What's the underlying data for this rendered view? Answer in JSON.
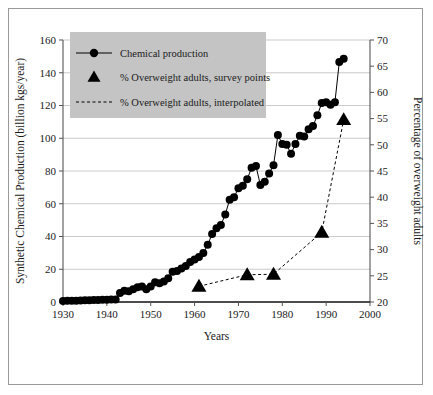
{
  "figure": {
    "background_color": "#ffffff",
    "border_color": "#9a9a9a",
    "legend_background": "#c4c4c4",
    "series_color": "#000000",
    "gridline_color": "#b5b5b5"
  },
  "chart_data": {
    "type": "line",
    "title": "",
    "xlabel": "Years",
    "ylabel": "Synthetic Chemical Production (billion kgs/year)",
    "y2label": "Percentage of overweight adults",
    "xlim": [
      1930,
      2000
    ],
    "ylim": [
      0,
      160
    ],
    "y2lim": [
      20,
      70
    ],
    "xticks": [
      1930,
      1940,
      1950,
      1960,
      1970,
      1980,
      1990,
      2000
    ],
    "xticklabels": [
      "1930",
      "1940",
      "1950",
      "1960",
      "1970",
      "1980",
      "1990",
      "2000"
    ],
    "yticks": [
      0,
      20,
      40,
      60,
      80,
      100,
      120,
      140,
      160
    ],
    "yticklabels": [
      "0",
      "20",
      "40",
      "60",
      "80",
      "100",
      "120",
      "140",
      "160"
    ],
    "y2ticks": [
      20,
      25,
      30,
      35,
      40,
      45,
      50,
      55,
      60,
      65,
      70
    ],
    "y2ticklabels": [
      "20",
      "25",
      "30",
      "35",
      "40",
      "45",
      "50",
      "55",
      "60",
      "65",
      "70"
    ],
    "grid": true,
    "grid_axis": "y",
    "legend_position": "upper-left",
    "series": [
      {
        "name": "Chemical production",
        "axis": "left",
        "marker": "circle",
        "linestyle": "solid",
        "x": [
          1930,
          1931,
          1932,
          1933,
          1934,
          1935,
          1936,
          1937,
          1938,
          1939,
          1940,
          1941,
          1942,
          1943,
          1944,
          1945,
          1946,
          1947,
          1948,
          1949,
          1950,
          1951,
          1952,
          1953,
          1954,
          1955,
          1956,
          1957,
          1958,
          1959,
          1960,
          1961,
          1962,
          1963,
          1964,
          1965,
          1966,
          1967,
          1968,
          1969,
          1970,
          1971,
          1972,
          1973,
          1974,
          1975,
          1976,
          1977,
          1978,
          1979,
          1980,
          1981,
          1982,
          1983,
          1984,
          1985,
          1986,
          1987,
          1988,
          1989,
          1990,
          1991,
          1992,
          1993,
          1994
        ],
        "values": [
          0.6,
          0.7,
          0.7,
          0.8,
          0.9,
          1.0,
          1.1,
          1.2,
          1.2,
          1.3,
          1.4,
          1.5,
          1.6,
          5.5,
          6.8,
          6.5,
          7.8,
          9.0,
          9.5,
          7.8,
          9.5,
          12.0,
          11.5,
          12.5,
          14.5,
          18.5,
          19.0,
          20.5,
          22.0,
          24.5,
          26.0,
          27.5,
          30.0,
          35.0,
          41.5,
          45.0,
          47.0,
          53.5,
          62.5,
          64.0,
          69.5,
          71.0,
          75.0,
          82.0,
          83.0,
          71.5,
          73.5,
          78.5,
          83.5,
          102.0,
          96.5,
          96.0,
          90.5,
          96.5,
          101.5,
          101.0,
          105.5,
          107.5,
          114.0,
          121.5,
          122.0,
          120.5,
          122.0,
          146.5,
          148.5
        ]
      },
      {
        "name": "% Overweight adults, survey points",
        "axis": "right",
        "marker": "triangle",
        "linestyle": "none",
        "x": [
          1961,
          1972,
          1978,
          1989,
          1994
        ],
        "values": [
          23.0,
          25.2,
          25.3,
          33.3,
          54.8
        ]
      },
      {
        "name": "% Overweight adults, interpolated",
        "axis": "right",
        "marker": "none",
        "linestyle": "dashed",
        "x": [
          1961,
          1972,
          1978,
          1989,
          1994
        ],
        "values": [
          23.0,
          25.2,
          25.3,
          33.3,
          54.8
        ]
      }
    ]
  },
  "legend": {
    "items": [
      {
        "label": "Chemical production",
        "marker": "circle-line"
      },
      {
        "label": "% Overweight adults, survey points",
        "marker": "triangle"
      },
      {
        "label": "% Overweight adults, interpolated",
        "marker": "dashed-line"
      }
    ]
  }
}
